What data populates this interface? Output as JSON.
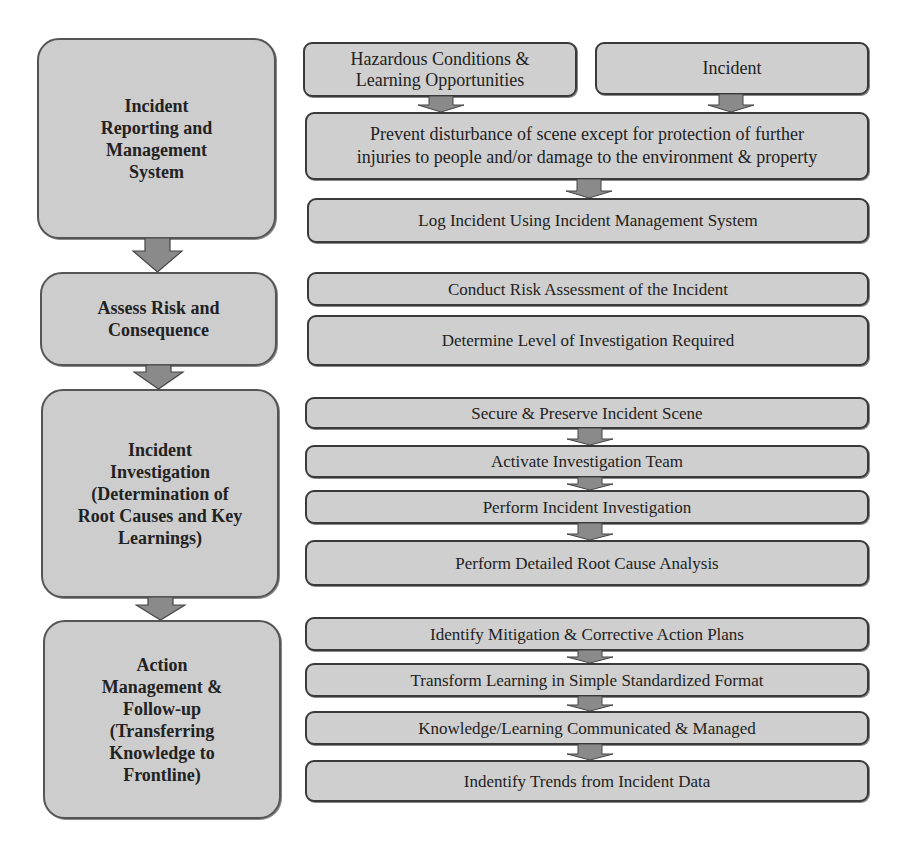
{
  "phases": [
    {
      "label": "Incident Reporting and Management System",
      "lines": [
        "Incident",
        "Reporting and",
        "Management",
        "System"
      ]
    },
    {
      "label": "Assess Risk and Consequence",
      "lines": [
        "Assess Risk and",
        "Consequence"
      ]
    },
    {
      "label": "Incident Investigation (Determination of Root Causes and Key Learnings)",
      "lines": [
        "Incident",
        "Investigation",
        "(Determination of",
        "Root Causes and Key",
        "Learnings)"
      ]
    },
    {
      "label": "Action Management & Follow-up (Transferring Knowledge to Frontline)",
      "lines": [
        "Action",
        "Management &",
        "Follow-up",
        "(Transferring",
        "Knowledge to",
        "Frontline)"
      ]
    }
  ],
  "triggers": [
    {
      "lines": [
        "Hazardous Conditions &",
        "Learning Opportunities"
      ]
    },
    {
      "lines": [
        "Incident"
      ]
    }
  ],
  "steps": {
    "reporting": [
      {
        "lines": [
          "Prevent disturbance of scene except for protection of further",
          "injuries to people and/or damage to the environment & property"
        ]
      },
      {
        "lines": [
          "Log Incident Using Incident Management System"
        ]
      }
    ],
    "assess": [
      {
        "lines": [
          "Conduct Risk Assessment of the Incident"
        ]
      },
      {
        "lines": [
          "Determine Level of Investigation Required"
        ]
      }
    ],
    "investigation": [
      {
        "lines": [
          "Secure & Preserve Incident Scene"
        ]
      },
      {
        "lines": [
          "Activate Investigation Team"
        ]
      },
      {
        "lines": [
          "Perform Incident Investigation"
        ]
      },
      {
        "lines": [
          "Perform Detailed Root Cause Analysis"
        ]
      }
    ],
    "action": [
      {
        "lines": [
          "Identify Mitigation & Corrective Action Plans"
        ]
      },
      {
        "lines": [
          "Transform Learning in Simple Standardized Format"
        ]
      },
      {
        "lines": [
          "Knowledge/Learning Communicated & Managed"
        ]
      },
      {
        "lines": [
          "Indentify Trends from Incident Data"
        ]
      }
    ]
  },
  "colors": {
    "box_fill": "#cfcfcf",
    "border": "#3a3a3a",
    "arrow_fill": "#8a8a8a"
  }
}
